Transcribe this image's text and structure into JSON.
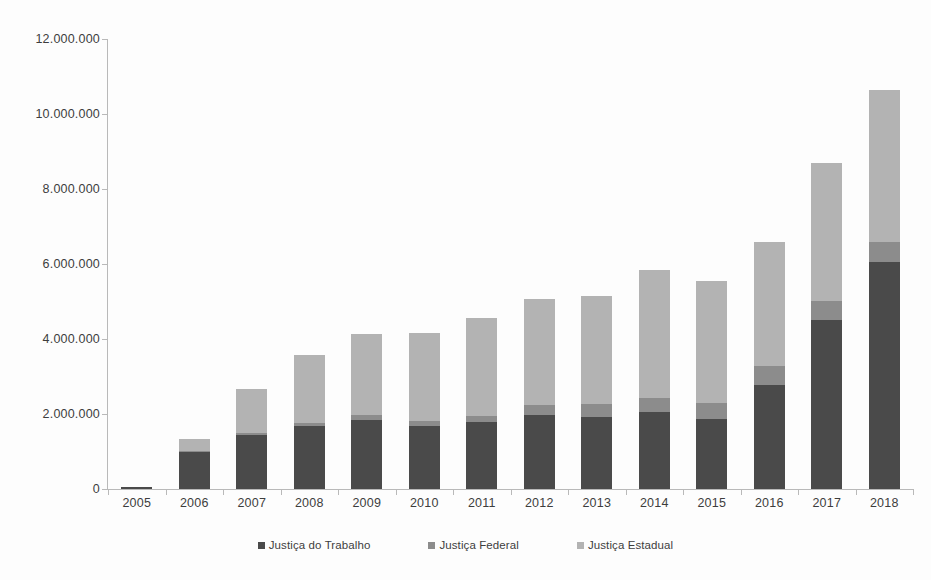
{
  "chart_data": {
    "type": "bar",
    "subtype": "stacked-column",
    "title": "",
    "xlabel": "",
    "ylabel": "",
    "categories": [
      "2005",
      "2006",
      "2007",
      "2008",
      "2009",
      "2010",
      "2011",
      "2012",
      "2013",
      "2014",
      "2015",
      "2016",
      "2017",
      "2018"
    ],
    "series": [
      {
        "name": "Justiça do Trabalho",
        "color": "#4a4a4a",
        "values": [
          55000,
          980000,
          1430000,
          1680000,
          1840000,
          1680000,
          1780000,
          1970000,
          1930000,
          2050000,
          1870000,
          2770000,
          4500000,
          6050000
        ]
      },
      {
        "name": "Justiça Federal",
        "color": "#8c8c8c",
        "values": [
          0,
          30000,
          60000,
          90000,
          130000,
          140000,
          180000,
          270000,
          350000,
          390000,
          430000,
          500000,
          520000,
          550000
        ]
      },
      {
        "name": "Justiça Estadual",
        "color": "#b3b3b3",
        "values": [
          0,
          320000,
          1180000,
          1800000,
          2160000,
          2340000,
          2600000,
          2830000,
          2870000,
          3400000,
          3250000,
          3310000,
          3680000,
          4050000
        ]
      }
    ],
    "totals": [
      55000,
      1330000,
      2670000,
      3570000,
      4130000,
      4160000,
      4560000,
      5070000,
      5150000,
      5840000,
      5550000,
      6580000,
      8700000,
      10650000
    ],
    "ylim": [
      0,
      12000000
    ],
    "y_ticks": [
      0,
      2000000,
      4000000,
      6000000,
      8000000,
      10000000,
      12000000
    ],
    "y_tick_labels": [
      "0",
      "2.000.000",
      "4.000.000",
      "6.000.000",
      "8.000.000",
      "10.000.000",
      "12.000.000"
    ],
    "grid": false,
    "legend_position": "bottom",
    "number_format": "pt-BR"
  },
  "legend": {
    "items": [
      {
        "label": "Justiça do Trabalho",
        "color": "#4a4a4a"
      },
      {
        "label": "Justiça Federal",
        "color": "#8c8c8c"
      },
      {
        "label": "Justiça Estadual",
        "color": "#b3b3b3"
      }
    ]
  },
  "colors": {
    "background": "#fdfdfd",
    "axis": "#b9b9b9",
    "text": "#3d3d3d",
    "trabalho": "#4a4a4a",
    "federal": "#8c8c8c",
    "estadual": "#b3b3b3"
  }
}
